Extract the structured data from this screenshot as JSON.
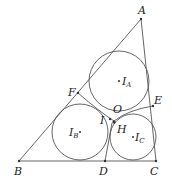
{
  "diagram": {
    "type": "geometry",
    "stroke_color": "#444444",
    "points": {
      "A": {
        "label": "A",
        "x": 141,
        "y": 19
      },
      "B": {
        "label": "B",
        "x": 19,
        "y": 161
      },
      "C": {
        "label": "C",
        "x": 156,
        "y": 161
      },
      "D": {
        "label": "D",
        "x": 105,
        "y": 161
      },
      "E": {
        "label": "E",
        "x": 153,
        "y": 106
      },
      "F": {
        "label": "F",
        "x": 78,
        "y": 93
      },
      "O": {
        "label": "O",
        "x": 113,
        "y": 116
      },
      "I": {
        "label": "I",
        "x": 109,
        "y": 119
      },
      "H": {
        "label": "H",
        "x": 116,
        "y": 124
      }
    },
    "circles": [
      {
        "center_label": "I",
        "subscript": "A",
        "cx": 119,
        "cy": 81,
        "r": 30
      },
      {
        "center_label": "I",
        "subscript": "B",
        "cx": 80,
        "cy": 132,
        "r": 28
      },
      {
        "center_label": "I",
        "subscript": "C",
        "cx": 133,
        "cy": 137,
        "r": 23
      }
    ],
    "segments": [
      "AB",
      "BC",
      "CA",
      "FH",
      "EH",
      "DH"
    ]
  }
}
